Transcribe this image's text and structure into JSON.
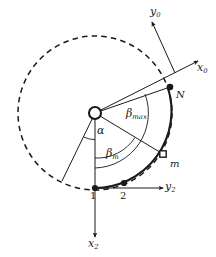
{
  "figure": {
    "background_color": "#ffffff",
    "ink_color": "#1a1a1a",
    "width": 216,
    "height": 257
  },
  "axes": [
    {
      "id": "y0",
      "symbol": "y",
      "subscript": "0",
      "label": "y_0",
      "direction": "upper-left",
      "style": "solid-arrow"
    },
    {
      "id": "x0",
      "symbol": "x",
      "subscript": "0",
      "label": "x_0",
      "direction": "upper-right",
      "style": "solid-arrow"
    },
    {
      "id": "y2",
      "symbol": "y",
      "subscript": "2",
      "label": "y_2",
      "direction": "right",
      "style": "solid-arrow"
    },
    {
      "id": "x2",
      "symbol": "x",
      "subscript": "2",
      "label": "x_2",
      "direction": "down",
      "style": "solid-arrow"
    }
  ],
  "angles": [
    {
      "id": "alpha",
      "symbol": "α",
      "subscript": "",
      "label": "α",
      "arc": "innermost"
    },
    {
      "id": "beta_m",
      "symbol": "β",
      "subscript": "m",
      "label": "β_m",
      "arc": "middle"
    },
    {
      "id": "beta_max",
      "symbol": "β",
      "subscript": "max",
      "label": "β_max",
      "arc": "outer"
    }
  ],
  "points": [
    {
      "id": "hub",
      "label": "",
      "marker": "open-circle-large",
      "role": "pivot-center"
    },
    {
      "id": "p1",
      "label": "1",
      "marker": "filled-dot",
      "role": "arc-start"
    },
    {
      "id": "p2",
      "label": "2",
      "marker": "filled-dot",
      "role": "arc-node"
    },
    {
      "id": "pm",
      "label": "m",
      "marker": "open-square-small",
      "role": "current-position"
    },
    {
      "id": "pN",
      "label": "N",
      "marker": "filled-dot",
      "role": "arc-end"
    }
  ],
  "curves": [
    {
      "id": "dashed-circle",
      "style": "dashed",
      "description": "full circle of motion radius"
    },
    {
      "id": "solid-arc",
      "style": "solid-thick",
      "description": "active arc from point 1 through 2 and m to N"
    }
  ]
}
